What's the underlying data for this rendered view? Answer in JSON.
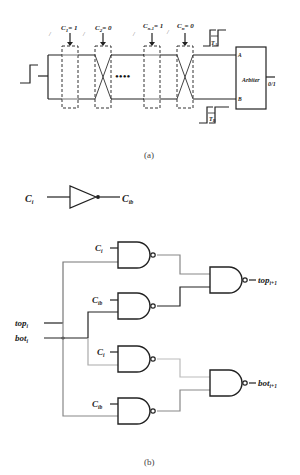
{
  "figure_a": {
    "caption": "(a)",
    "stages": [
      {
        "label": "C",
        "sub": "1",
        "value": "= 1",
        "type": "straight"
      },
      {
        "label": "C",
        "sub": "2",
        "value": "= 0",
        "type": "cross"
      },
      {
        "label": "C",
        "sub": "n-1",
        "value": "= 1",
        "type": "straight"
      },
      {
        "label": "C",
        "sub": "n",
        "value": "= 0",
        "type": "cross"
      }
    ],
    "ellipsis": "••••",
    "arbiter": {
      "label": "Arbiter",
      "input_a": "A",
      "input_b": "B",
      "output": "0/1"
    },
    "delay_top": "T",
    "delay_top_sub": "A",
    "delay_bottom": "T",
    "delay_bottom_sub": "B"
  },
  "figure_b": {
    "caption": "(b)",
    "inverter": {
      "input": "C",
      "input_sub": "i",
      "output": "C",
      "output_sub": "ib"
    },
    "inputs": [
      {
        "label": "top",
        "sub": "i"
      },
      {
        "label": "bot",
        "sub": "i"
      }
    ],
    "gate_labels": [
      {
        "label": "C",
        "sub": "i"
      },
      {
        "label": "C",
        "sub": "ib"
      },
      {
        "label": "C",
        "sub": "i"
      },
      {
        "label": "C",
        "sub": "ib"
      }
    ],
    "outputs": [
      {
        "label": "top",
        "sub": "i+1"
      },
      {
        "label": "bot",
        "sub": "i+1"
      }
    ]
  },
  "colors": {
    "line": "#222222",
    "gray_wire": "#888888",
    "light_wire": "#aaaaaa"
  }
}
